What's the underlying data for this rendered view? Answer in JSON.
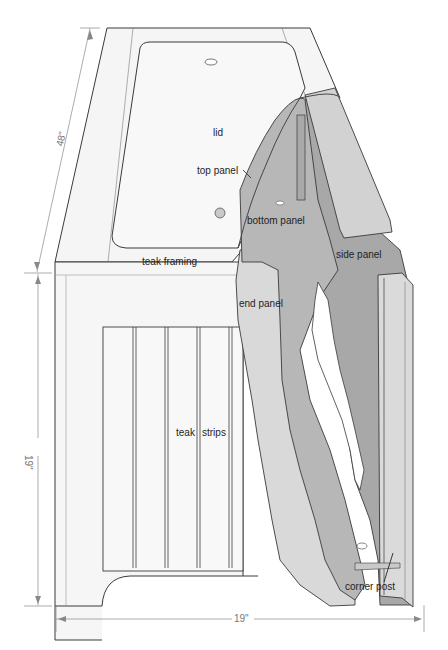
{
  "diagram": {
    "labels": {
      "lid": "lid",
      "top_panel": "top panel",
      "bottom_panel": "bottom panel",
      "side_panel": "side panel",
      "teak_framing": "teak framing",
      "end_panel": "end panel",
      "teak_strips_1": "teak",
      "teak_strips_2": "strips",
      "corner_post": "corner post"
    },
    "dimensions": {
      "length": "48\"",
      "height": "19\"",
      "width": "19\""
    },
    "colors": {
      "background": "#ffffff",
      "framing_fill": "#f4f4f4",
      "light_panel": "#d9d9d9",
      "mid_panel": "#b5b5b5",
      "dark_panel": "#a6a6a6",
      "line": "#3a3a3a",
      "dimension_line": "#888888"
    }
  }
}
